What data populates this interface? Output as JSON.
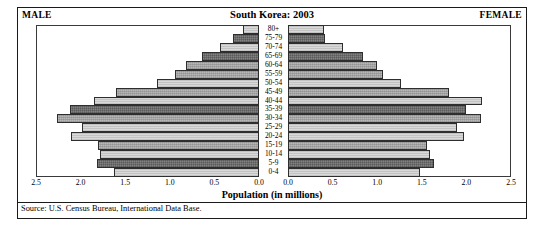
{
  "header": {
    "male_label": "MALE",
    "female_label": "FEMALE",
    "title": "South Korea: 2003"
  },
  "axis": {
    "title": "Population (in millions)",
    "male_ticks": [
      "2.5",
      "2.0",
      "1.5",
      "1.0",
      "0.5",
      "0.0"
    ],
    "female_ticks": [
      "0.0",
      "0.5",
      "1.0",
      "1.5",
      "2.0",
      "2.5"
    ]
  },
  "source": "Source: U.S. Census Bureau, International Data Base.",
  "chart_data": {
    "type": "bar",
    "subtype": "population-pyramid",
    "title": "South Korea: 2003",
    "xlabel": "Population (in millions)",
    "ylabel": "",
    "xlim": [
      0,
      2.5
    ],
    "grid": false,
    "legend": "none",
    "categories": [
      "80+",
      "75-79",
      "70-74",
      "65-69",
      "60-64",
      "55-59",
      "50-54",
      "45-49",
      "40-44",
      "35-39",
      "30-34",
      "25-29",
      "20-24",
      "15-19",
      "10-14",
      "5-9",
      "0-4"
    ],
    "series": [
      {
        "name": "MALE",
        "side": "left",
        "values": [
          0.18,
          0.29,
          0.44,
          0.64,
          0.82,
          0.94,
          1.14,
          1.6,
          1.85,
          2.12,
          2.26,
          1.99,
          2.11,
          1.8,
          1.78,
          1.82,
          1.63
        ]
      },
      {
        "name": "FEMALE",
        "side": "right",
        "values": [
          0.4,
          0.42,
          0.62,
          0.84,
          1.0,
          1.06,
          1.27,
          1.81,
          2.17,
          1.99,
          2.16,
          1.9,
          1.97,
          1.56,
          1.59,
          1.64,
          1.48
        ]
      }
    ],
    "bar_fills": [
      "light",
      "dark",
      "light",
      "dark",
      "mid",
      "mid",
      "light",
      "mid",
      "light",
      "dark",
      "mid",
      "light",
      "light",
      "mid",
      "light",
      "dark",
      "light"
    ]
  },
  "colors": {
    "fill_light": "#d9d9d9",
    "fill_mid": "#a9a9a9",
    "fill_dark": "#6d6d6d",
    "outline": "#2e2e2e",
    "frame": "#1a1a1a"
  }
}
